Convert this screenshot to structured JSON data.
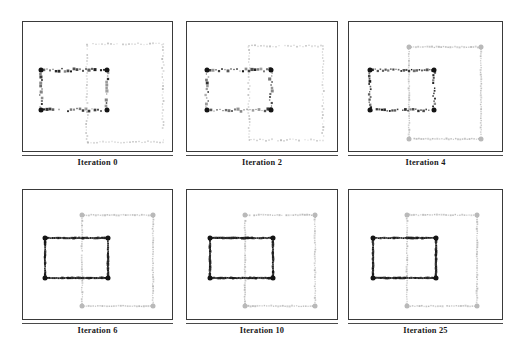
{
  "figure": {
    "type": "contour-evolution-sequence",
    "background_color": "#ffffff",
    "frame_color": "#3a3a3a",
    "width": 524,
    "height": 356,
    "rows": 2,
    "cols": 3
  },
  "colors": {
    "dark_contour": "#141414",
    "light_contour": "#b9b9b9",
    "frame": "#3a3a3a",
    "caption_text": "#1a1a1a",
    "caption_rule": "#4a4a4a",
    "background": "#ffffff"
  },
  "panels": [
    {
      "id": "panel-iteration-0",
      "caption": "Iteration 0",
      "row": 0,
      "col": 0,
      "x": 22,
      "y": 21,
      "w": 151,
      "h": 131,
      "caption_y": 160,
      "dark_rect": {
        "x": 18,
        "y": 48,
        "w": 66,
        "h": 40
      },
      "light_rect": {
        "x": 64,
        "y": 22,
        "w": 76,
        "h": 98
      },
      "dark_marker_density": "sparse-heavy",
      "light_marker_density": "sparse"
    },
    {
      "id": "panel-iteration-2",
      "caption": "Iteration 2",
      "row": 0,
      "col": 1,
      "x": 186,
      "y": 21,
      "w": 152,
      "h": 131,
      "caption_y": 160,
      "dark_rect": {
        "x": 20,
        "y": 48,
        "w": 64,
        "h": 40
      },
      "light_rect": {
        "x": 62,
        "y": 24,
        "w": 74,
        "h": 94
      },
      "dark_marker_density": "sparse-heavy",
      "light_marker_density": "sparse"
    },
    {
      "id": "panel-iteration-4",
      "caption": "Iteration 4",
      "row": 0,
      "col": 2,
      "x": 348,
      "y": 21,
      "w": 155,
      "h": 131,
      "caption_y": 160,
      "dark_rect": {
        "x": 21,
        "y": 48,
        "w": 64,
        "h": 40
      },
      "light_rect": {
        "x": 60,
        "y": 25,
        "w": 72,
        "h": 92
      },
      "dark_marker_density": "medium",
      "light_marker_density": "dense"
    },
    {
      "id": "panel-iteration-6",
      "caption": "Iteration 6",
      "row": 1,
      "col": 0,
      "x": 22,
      "y": 189,
      "w": 151,
      "h": 131,
      "caption_y": 328,
      "dark_rect": {
        "x": 22,
        "y": 48,
        "w": 63,
        "h": 40
      },
      "light_rect": {
        "x": 59,
        "y": 25,
        "w": 71,
        "h": 91
      },
      "dark_marker_density": "solid",
      "light_marker_density": "dense"
    },
    {
      "id": "panel-iteration-10",
      "caption": "Iteration 10",
      "row": 1,
      "col": 1,
      "x": 186,
      "y": 189,
      "w": 152,
      "h": 131,
      "caption_y": 328,
      "dark_rect": {
        "x": 23,
        "y": 48,
        "w": 63,
        "h": 40
      },
      "light_rect": {
        "x": 58,
        "y": 25,
        "w": 70,
        "h": 91
      },
      "dark_marker_density": "solid",
      "light_marker_density": "dense"
    },
    {
      "id": "panel-iteration-25",
      "caption": "Iteration 25",
      "row": 1,
      "col": 2,
      "x": 348,
      "y": 189,
      "w": 155,
      "h": 131,
      "caption_y": 328,
      "dark_rect": {
        "x": 24,
        "y": 48,
        "w": 63,
        "h": 40
      },
      "light_rect": {
        "x": 58,
        "y": 25,
        "w": 70,
        "h": 91
      },
      "dark_marker_density": "solid",
      "light_marker_density": "dense"
    }
  ],
  "chart_data": {
    "type": "scatter",
    "title": "",
    "xlabel": "",
    "ylabel": "",
    "grid": false,
    "legend": "none",
    "series": [
      {
        "name": "dark-contour",
        "color": "#141414",
        "marker": "filled-dot"
      },
      {
        "name": "light-contour",
        "color": "#b9b9b9",
        "marker": "open-dot"
      }
    ],
    "categories": [
      "Iteration 0",
      "Iteration 2",
      "Iteration 4",
      "Iteration 6",
      "Iteration 10",
      "Iteration 25"
    ],
    "values": [
      0,
      2,
      4,
      6,
      10,
      25
    ]
  }
}
